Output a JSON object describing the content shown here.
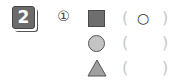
{
  "question": {
    "number": "2",
    "item_marker": "①"
  },
  "rows": [
    {
      "shape": "square",
      "shape_color": "#6e6e6e",
      "open": "(",
      "answer": "○",
      "close": ")"
    },
    {
      "shape": "circle",
      "shape_color": "#c4c4c4",
      "open": "(",
      "answer": "",
      "close": ")"
    },
    {
      "shape": "triangle",
      "shape_color": "#a0a0a0",
      "open": "(",
      "answer": "",
      "close": ")"
    }
  ]
}
